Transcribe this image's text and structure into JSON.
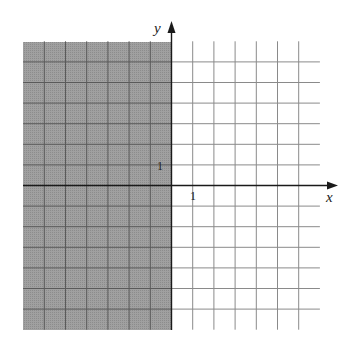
{
  "chart_data": {
    "type": "region",
    "title": "",
    "xlabel": "x",
    "ylabel": "y",
    "xlim": [
      -7,
      7
    ],
    "ylim": [
      -7,
      7
    ],
    "grid": true,
    "grid_step": 1,
    "tick_labels": {
      "x": [
        "1"
      ],
      "y": [
        "1"
      ]
    },
    "shaded_region": {
      "x_min": -7,
      "x_max": 0,
      "y_min": -7,
      "y_max": 7,
      "boundary": "x = 0",
      "boundary_style": "solid"
    },
    "colors": {
      "shade": "#9b9b9b",
      "shade_grid": "#5a5a5a",
      "grid": "#8a8a8a",
      "axis": "#1a1a1a"
    }
  },
  "labels": {
    "x_axis": "x",
    "y_axis": "y",
    "x_tick": "1",
    "y_tick": "1"
  }
}
